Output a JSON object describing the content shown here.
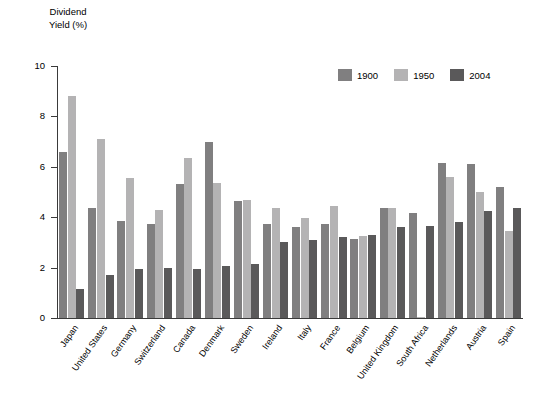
{
  "chart_data": {
    "type": "bar",
    "title": "",
    "subtitle": "",
    "xlabel": "",
    "ylabel": "Dividend\nYield (%)",
    "ylim": [
      0,
      10
    ],
    "ytick_values": [
      0,
      2,
      4,
      6,
      8,
      10
    ],
    "ytick_labels": [
      "0",
      "2",
      "4",
      "6",
      "8",
      "10"
    ],
    "grid": false,
    "legend_position": "top-right",
    "categories": [
      "Japan",
      "United States",
      "Germany",
      "Switzerland",
      "Canada",
      "Denmark",
      "Sweden",
      "Ireland",
      "Italy",
      "France",
      "Belgium",
      "United Kingdom",
      "South Africa",
      "Netherlands",
      "Austria",
      "Spain"
    ],
    "series": [
      {
        "name": "1900",
        "color": "#807f80",
        "values": [
          6.6,
          4.35,
          3.85,
          3.75,
          5.3,
          7.0,
          4.65,
          3.75,
          3.6,
          3.75,
          3.15,
          4.35,
          4.15,
          6.15,
          6.1,
          5.2
        ]
      },
      {
        "name": "1950",
        "color": "#b4b3b4",
        "values": [
          8.8,
          7.1,
          5.55,
          4.3,
          6.35,
          5.35,
          4.7,
          4.35,
          3.95,
          4.45,
          3.25,
          4.35,
          0.05,
          5.6,
          5.0,
          3.45
        ]
      },
      {
        "name": "2004",
        "color": "#5a595a",
        "values": [
          1.15,
          1.7,
          1.95,
          2.0,
          1.95,
          2.05,
          2.15,
          3.0,
          3.1,
          3.2,
          3.3,
          3.6,
          3.65,
          3.8,
          4.25,
          4.35
        ]
      }
    ]
  }
}
